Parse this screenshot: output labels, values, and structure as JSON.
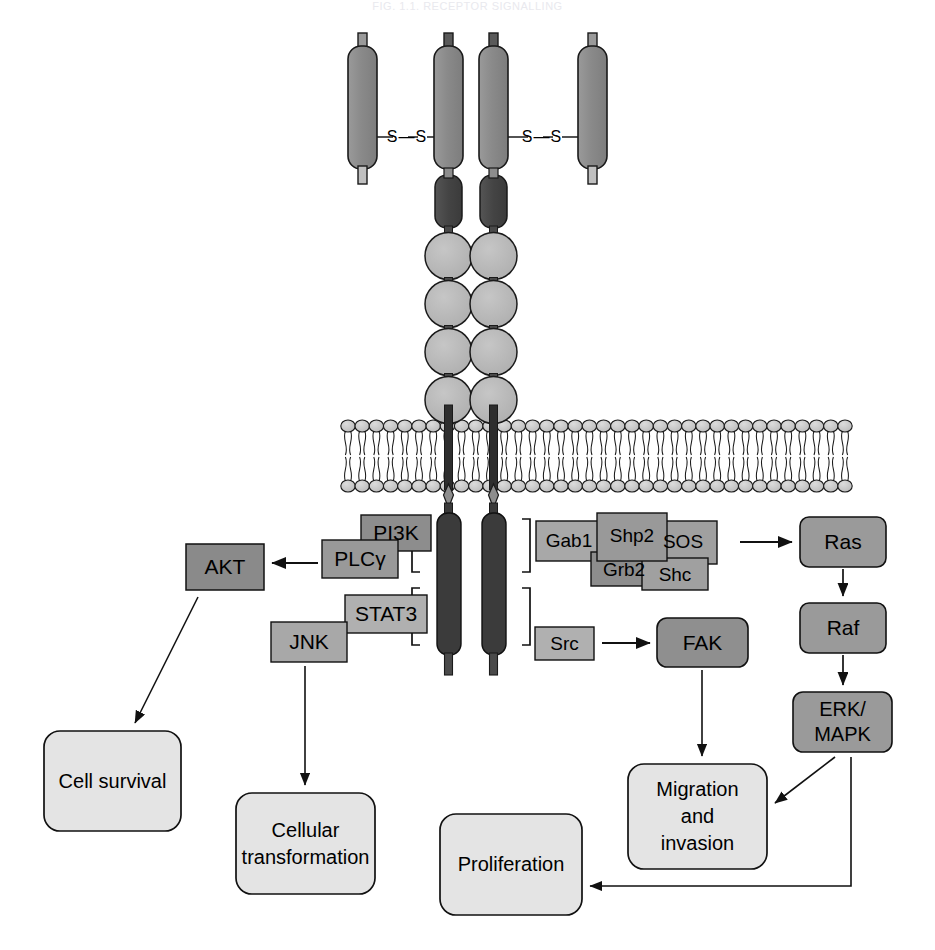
{
  "header": {
    "running_title": "FIG. 1.1. RECEPTOR SIGNALLING"
  },
  "diagram": {
    "disulfide_labels": [
      "S",
      "S",
      "S",
      "S"
    ],
    "disulfide_text": "S—S",
    "receptor": {
      "ectodomain_count": 4,
      "kinase_circle_count": 4,
      "transmembrane_count": 2
    },
    "colors": {
      "ectodomain_fill": "#8c8c8c",
      "dark_domain_fill": "#4a4a4a",
      "circle_fill": "#b7b7b7",
      "membrane_head_fill": "#c9c9c9",
      "adaptor_fill_light": "#b3b3b3",
      "adaptor_fill_mid": "#9a9a9a",
      "effector_fill": "#8f8f8f",
      "outcome_fill": "#e3e3e3",
      "stroke": "#1a1a1a"
    }
  },
  "nodes": {
    "pi3k": {
      "label": "PI3K"
    },
    "plcg": {
      "label": "PLCγ"
    },
    "stat3": {
      "label": "STAT3"
    },
    "jnk": {
      "label": "JNK"
    },
    "akt": {
      "label": "AKT"
    },
    "gab1": {
      "label": "Gab1"
    },
    "shp2": {
      "label": "Shp2"
    },
    "sos": {
      "label": "SOS"
    },
    "grb2": {
      "label": "Grb2"
    },
    "shc": {
      "label": "Shc"
    },
    "src": {
      "label": "Src"
    },
    "fak": {
      "label": "FAK"
    },
    "ras": {
      "label": "Ras"
    },
    "raf": {
      "label": "Raf"
    },
    "erk_mapk": {
      "label": "ERK/\nMAPK"
    },
    "cell_survival": {
      "label": "Cell survival"
    },
    "cellular_transformation": {
      "label": "Cellular\ntransformation"
    },
    "migration_invasion": {
      "label": "Migration\nand\ninvasion"
    },
    "proliferation": {
      "label": "Proliferation"
    }
  },
  "edges": [
    {
      "from": "plcg",
      "to": "akt"
    },
    {
      "from": "sos",
      "to": "ras"
    },
    {
      "from": "ras",
      "to": "raf"
    },
    {
      "from": "raf",
      "to": "erk_mapk"
    },
    {
      "from": "src",
      "to": "fak"
    },
    {
      "from": "akt",
      "to": "cell_survival"
    },
    {
      "from": "jnk",
      "to": "cellular_transformation"
    },
    {
      "from": "fak",
      "to": "migration_invasion"
    },
    {
      "from": "erk_mapk",
      "to": "migration_invasion"
    },
    {
      "from": "erk_mapk",
      "to": "proliferation"
    }
  ]
}
